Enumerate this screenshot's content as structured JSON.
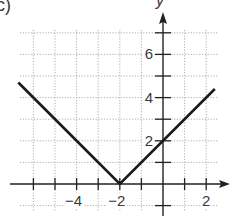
{
  "figure": {
    "panel_label": "c)",
    "y_axis_label": "y"
  },
  "chart_data": {
    "type": "line",
    "title": "",
    "panel_label": "c)",
    "xlabel": "",
    "ylabel": "y",
    "function": "y = |x + 2|",
    "xlim": [
      -7,
      3
    ],
    "ylim": [
      -1,
      8
    ],
    "grid": true,
    "grid_style": "dotted",
    "x_ticks": [
      -6,
      -5,
      -4,
      -3,
      -2,
      -1,
      1,
      2
    ],
    "x_tick_labels": [
      "-4",
      "-2",
      "2"
    ],
    "x_tick_label_values": [
      -4,
      -2,
      2
    ],
    "y_ticks": [
      -1,
      1,
      2,
      3,
      4,
      5,
      6,
      7
    ],
    "y_tick_labels": [
      "2",
      "4",
      "6"
    ],
    "y_tick_label_values": [
      2,
      4,
      6
    ],
    "series": [
      {
        "name": "y = |x + 2|",
        "x": [
          -6.7,
          -2,
          2.4
        ],
        "y": [
          4.7,
          0,
          4.4
        ],
        "color": "#1a1a1a"
      }
    ],
    "vertex": {
      "x": -2,
      "y": 0
    },
    "legend": null
  }
}
